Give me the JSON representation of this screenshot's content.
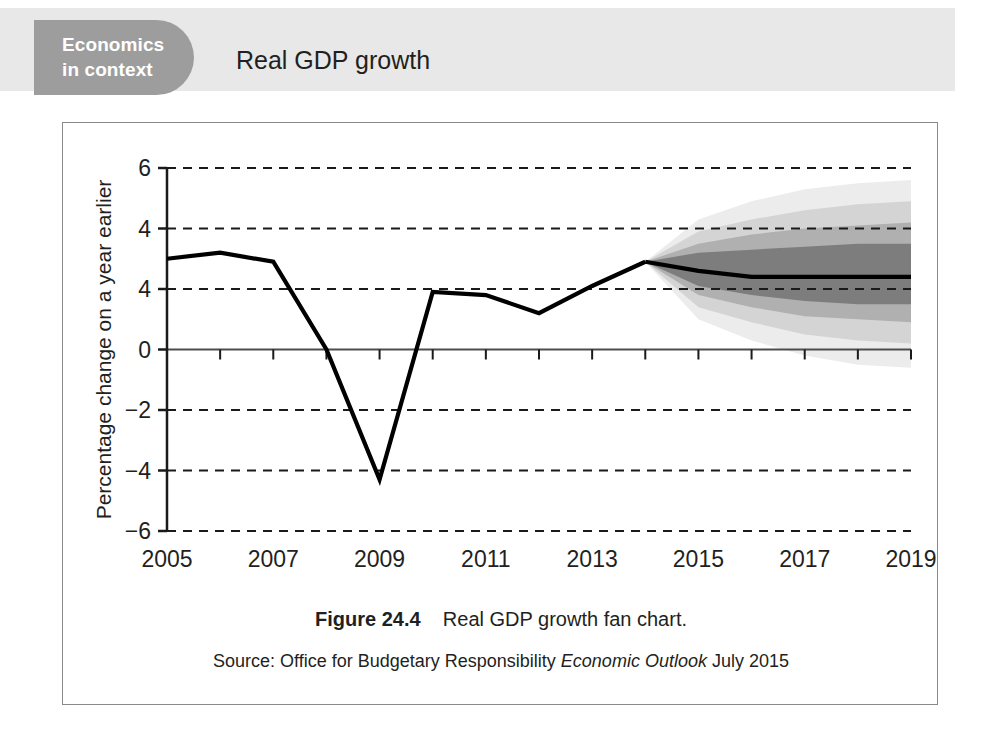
{
  "header": {
    "badge_line_1": "Economics",
    "badge_line_2": "in context",
    "title": "Real GDP growth",
    "badge_color": "#9d9d9d",
    "band_color": "#e8e8e8"
  },
  "figure": {
    "caption_label": "Figure 24.4",
    "caption_text": "Real GDP growth fan chart.",
    "source_prefix": "Source: Office for Budgetary Responsibility ",
    "source_italic": "Economic Outlook",
    "source_suffix": " July 2015"
  },
  "chart_data": {
    "type": "line",
    "title": "Real GDP growth fan chart",
    "xlabel": "",
    "ylabel": "Percentage change on a year earlier",
    "xlim": [
      2005,
      2019
    ],
    "ylim": [
      -6,
      6
    ],
    "grid": true,
    "legend": null,
    "x_tick_labels": [
      "2005",
      "2007",
      "2009",
      "2011",
      "2013",
      "2015",
      "2017",
      "2019"
    ],
    "x_tick_values": [
      2005,
      2007,
      2009,
      2011,
      2013,
      2015,
      2017,
      2019
    ],
    "x_minor_tick_values": [
      2006,
      2008,
      2010,
      2012,
      2014,
      2016,
      2018
    ],
    "y_tick_labels": [
      "6",
      "4",
      "4",
      "0",
      "-2",
      "-4",
      "-6"
    ],
    "y_tick_values": [
      6,
      4,
      2,
      0,
      -2,
      -4,
      -6
    ],
    "gridline_values": [
      6,
      4,
      2,
      -2,
      -4,
      -6
    ],
    "zero_axis_value": 0,
    "series": [
      {
        "name": "Real GDP growth (outturn)",
        "kind": "history",
        "x": [
          2005,
          2006,
          2007,
          2008,
          2009,
          2010,
          2011,
          2012,
          2013,
          2014
        ],
        "values": [
          3.0,
          3.2,
          2.9,
          0.0,
          -4.3,
          1.9,
          1.8,
          1.2,
          2.1,
          2.9
        ]
      },
      {
        "name": "Real GDP growth (central forecast)",
        "kind": "forecast",
        "x": [
          2014,
          2015,
          2016,
          2017,
          2018,
          2019
        ],
        "values": [
          2.9,
          2.6,
          2.4,
          2.4,
          2.4,
          2.4
        ]
      }
    ],
    "fan_bands": [
      {
        "name": "outer-band",
        "color": "#ececec",
        "x": [
          2014,
          2015,
          2016,
          2017,
          2018,
          2019
        ],
        "upper": [
          2.9,
          4.3,
          4.9,
          5.3,
          5.5,
          5.6
        ],
        "lower": [
          2.9,
          1.0,
          0.3,
          -0.2,
          -0.5,
          -0.6
        ]
      },
      {
        "name": "mid-outer-band",
        "color": "#d4d4d4",
        "x": [
          2014,
          2015,
          2016,
          2017,
          2018,
          2019
        ],
        "upper": [
          2.9,
          3.9,
          4.3,
          4.6,
          4.8,
          4.9
        ],
        "lower": [
          2.9,
          1.4,
          0.9,
          0.5,
          0.3,
          0.2
        ]
      },
      {
        "name": "mid-inner-band",
        "color": "#b0b0b0",
        "x": [
          2014,
          2015,
          2016,
          2017,
          2018,
          2019
        ],
        "upper": [
          2.9,
          3.5,
          3.8,
          4.0,
          4.1,
          4.2
        ],
        "lower": [
          2.9,
          1.8,
          1.4,
          1.1,
          1.0,
          0.9
        ]
      },
      {
        "name": "inner-band",
        "color": "#7d7d7d",
        "x": [
          2014,
          2015,
          2016,
          2017,
          2018,
          2019
        ],
        "upper": [
          2.9,
          3.2,
          3.3,
          3.4,
          3.5,
          3.5
        ],
        "lower": [
          2.9,
          2.1,
          1.8,
          1.6,
          1.5,
          1.5
        ]
      }
    ]
  }
}
